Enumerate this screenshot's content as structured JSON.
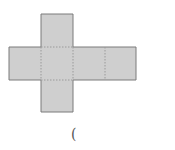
{
  "figure": {
    "type": "cube-net",
    "fill_color": "#cfcfcf",
    "edge_color": "#7a7a7a",
    "fold_line_color": "#9a9a9a",
    "squares": [
      {
        "name": "top",
        "x": 41,
        "y": 14
      },
      {
        "name": "left",
        "x": 9,
        "y": 47
      },
      {
        "name": "center",
        "x": 41,
        "y": 47
      },
      {
        "name": "right-1",
        "x": 73,
        "y": 47
      },
      {
        "name": "right-2",
        "x": 105,
        "y": 47
      },
      {
        "name": "bottom",
        "x": 41,
        "y": 80
      }
    ],
    "square_size": 32
  },
  "answer_blank": {
    "text": "("
  }
}
